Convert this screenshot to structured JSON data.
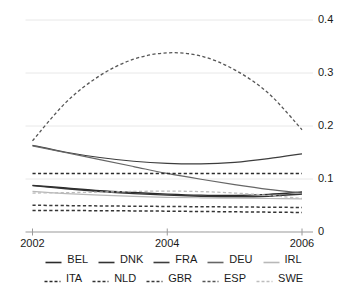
{
  "chart_data": {
    "type": "line",
    "title": "",
    "subtitle": "",
    "xlabel": "",
    "ylabel": "",
    "xlim": [
      2002,
      2006
    ],
    "ylim": [
      0,
      0.4
    ],
    "x_ticks": [
      "2002",
      "2004",
      "2006"
    ],
    "x_tick_values": [
      2002,
      2004,
      2006
    ],
    "y_ticks": [
      "0",
      "0.1",
      "0.2",
      "0.3",
      "0.4"
    ],
    "y_tick_values": [
      0,
      0.1,
      0.2,
      0.3,
      0.4
    ],
    "grid": "horizontal",
    "legend_position": "bottom",
    "x": [
      2002,
      2002.5,
      2003,
      2003.5,
      2004,
      2004.5,
      2005,
      2005.5,
      2006
    ],
    "series": [
      {
        "name": "BEL",
        "style": "solid",
        "color": "#2b2b2b",
        "width": 1.4,
        "values": [
          0.088,
          0.083,
          0.078,
          0.0745,
          0.0715,
          0.0695,
          0.069,
          0.071,
          0.0755
        ]
      },
      {
        "name": "DNK",
        "style": "solid",
        "color": "#333333",
        "width": 1.4,
        "values": [
          0.0875,
          0.0815,
          0.0765,
          0.0725,
          0.0695,
          0.0675,
          0.0665,
          0.0675,
          0.0715
        ]
      },
      {
        "name": "FRA",
        "style": "solid",
        "color": "#3d3d3d",
        "width": 1.2,
        "values": [
          0.1635,
          0.1505,
          0.1405,
          0.1335,
          0.1295,
          0.1285,
          0.1315,
          0.1385,
          0.1475
        ]
      },
      {
        "name": "DEU",
        "style": "solid",
        "color": "#666666",
        "width": 1.2,
        "values": [
          0.1625,
          0.1495,
          0.1365,
          0.1235,
          0.1105,
          0.0995,
          0.0895,
          0.0805,
          0.0735
        ]
      },
      {
        "name": "IRL",
        "style": "solid",
        "color": "#b8b8b8",
        "width": 1.2,
        "values": [
          0.0765,
          0.0725,
          0.0695,
          0.0672,
          0.0655,
          0.0645,
          0.0638,
          0.0632,
          0.0625
        ]
      },
      {
        "name": "ITA",
        "style": "dashed",
        "color": "#2b2b2b",
        "width": 1.5,
        "values": [
          0.1105,
          0.1105,
          0.1105,
          0.1105,
          0.1105,
          0.1105,
          0.1105,
          0.1105,
          0.1105
        ]
      },
      {
        "name": "NLD",
        "style": "dashed",
        "color": "#333333",
        "width": 1.5,
        "values": [
          0.0405,
          0.0405,
          0.0402,
          0.0398,
          0.0393,
          0.0387,
          0.0381,
          0.0375,
          0.0368
        ]
      },
      {
        "name": "GBR",
        "style": "dashed",
        "color": "#3a3a3a",
        "width": 1.5,
        "values": [
          0.0505,
          0.0498,
          0.0492,
          0.0487,
          0.0482,
          0.0477,
          0.0472,
          0.0468,
          0.0462
        ]
      },
      {
        "name": "ESP",
        "style": "dashed",
        "color": "#555555",
        "width": 1.3,
        "values": [
          0.172,
          0.245,
          0.295,
          0.326,
          0.338,
          0.332,
          0.306,
          0.262,
          0.193
        ]
      },
      {
        "name": "SWE",
        "style": "dashed",
        "color": "#bdbdbd",
        "width": 1.3,
        "values": [
          0.0735,
          0.0742,
          0.0752,
          0.0765,
          0.0772,
          0.0762,
          0.0735,
          0.0692,
          0.0632
        ]
      }
    ]
  },
  "axes": {
    "y_labels": [
      {
        "text": "0.4",
        "value": 0.4
      },
      {
        "text": "0.3",
        "value": 0.3
      },
      {
        "text": "0.2",
        "value": 0.2
      },
      {
        "text": "0.1",
        "value": 0.1
      },
      {
        "text": "0",
        "value": 0
      }
    ],
    "x_labels": [
      {
        "text": "2002",
        "value": 2002
      },
      {
        "text": "2004",
        "value": 2004
      },
      {
        "text": "2006",
        "value": 2006
      }
    ]
  },
  "legend": {
    "rows": [
      [
        {
          "label": "BEL",
          "style": "solid",
          "color": "#2b2b2b"
        },
        {
          "label": "DNK",
          "style": "solid",
          "color": "#333333"
        },
        {
          "label": "FRA",
          "style": "solid",
          "color": "#3d3d3d"
        },
        {
          "label": "DEU",
          "style": "solid",
          "color": "#666666"
        },
        {
          "label": "IRL",
          "style": "solid",
          "color": "#b8b8b8"
        }
      ],
      [
        {
          "label": "ITA",
          "style": "dashed",
          "color": "#2b2b2b"
        },
        {
          "label": "NLD",
          "style": "dashed",
          "color": "#333333"
        },
        {
          "label": "GBR",
          "style": "dashed",
          "color": "#3a3a3a"
        },
        {
          "label": "ESP",
          "style": "dashed",
          "color": "#555555"
        },
        {
          "label": "SWE",
          "style": "dashed",
          "color": "#bdbdbd"
        }
      ]
    ]
  },
  "colors": {
    "background": "#ffffff",
    "grid": "#e8e8e8",
    "axis": "#9a9a9a",
    "text": "#1a1a1a"
  }
}
